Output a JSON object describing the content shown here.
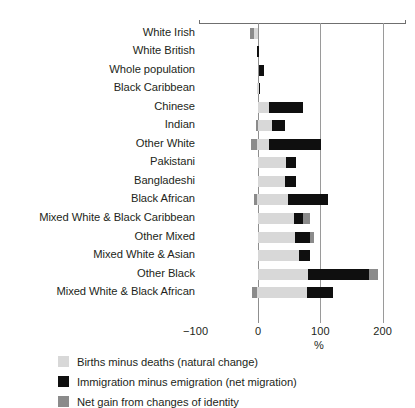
{
  "chart_data": {
    "type": "bar",
    "orientation": "horizontal",
    "stacked": true,
    "title": "",
    "subtitle": "",
    "xlabel": "%",
    "ylabel": "",
    "xlim": [
      -100,
      200
    ],
    "xticks": [
      -100,
      0,
      100,
      200
    ],
    "xticklabels": [
      "−100",
      "0",
      "100",
      "200"
    ],
    "grid": "vertical gridlines at 0, 100, 200",
    "legend_position": "bottom-left",
    "categories": [
      "White Irish",
      "White British",
      "Whole population",
      "Black Caribbean",
      "Chinese",
      "Indian",
      "Other White",
      "Pakistani",
      "Bangladeshi",
      "Black African",
      "Mixed White & Black Caribbean",
      "Other Mixed",
      "Mixed White & Asian",
      "Other Black",
      "Mixed White & Black African"
    ],
    "series": [
      {
        "name": "Births minus deaths (natural change)",
        "color": "#d8d8d8",
        "values": [
          -7,
          1,
          8,
          3,
          17,
          22,
          20,
          45,
          44,
          48,
          57,
          60,
          65,
          80,
          78
        ]
      },
      {
        "name": "Immigration minus emigration (net migration)",
        "color": "#0f0f0f",
        "values": [
          0,
          -2,
          0,
          -2,
          56,
          22,
          82,
          16,
          16,
          64,
          14,
          28,
          18,
          98,
          42
        ]
      },
      {
        "name": "Net gain from changes of identity",
        "color": "#8b8b8b",
        "values": [
          -6,
          0,
          0,
          0,
          0,
          -3,
          -10,
          0,
          0,
          -5,
          10,
          5,
          0,
          14,
          -8
        ]
      }
    ],
    "bars": [
      {
        "category": "White Irish",
        "segments": [
          {
            "series": "Net gain from changes of identity",
            "start": -13,
            "end": -7
          },
          {
            "series": "Births minus deaths (natural change)",
            "start": -7,
            "end": 0
          }
        ]
      },
      {
        "category": "White British",
        "segments": [
          {
            "series": "Immigration minus emigration (net migration)",
            "start": -1,
            "end": 1
          }
        ]
      },
      {
        "category": "Whole population",
        "segments": [
          {
            "series": "Immigration minus emigration (net migration)",
            "start": 2,
            "end": 9
          }
        ]
      },
      {
        "category": "Black Caribbean",
        "segments": [
          {
            "series": "Births minus deaths (natural change)",
            "start": -1,
            "end": 2
          },
          {
            "series": "Immigration minus emigration (net migration)",
            "start": 2,
            "end": 4
          }
        ]
      },
      {
        "category": "Chinese",
        "segments": [
          {
            "series": "Births minus deaths (natural change)",
            "start": 0,
            "end": 17
          },
          {
            "series": "Immigration minus emigration (net migration)",
            "start": 17,
            "end": 73
          }
        ]
      },
      {
        "category": "Indian",
        "segments": [
          {
            "series": "Net gain from changes of identity",
            "start": -4,
            "end": 0
          },
          {
            "series": "Births minus deaths (natural change)",
            "start": 0,
            "end": 22
          },
          {
            "series": "Immigration minus emigration (net migration)",
            "start": 22,
            "end": 44
          }
        ]
      },
      {
        "category": "Other White",
        "segments": [
          {
            "series": "Net gain from changes of identity",
            "start": -12,
            "end": -2
          },
          {
            "series": "Births minus deaths (natural change)",
            "start": -2,
            "end": 18
          },
          {
            "series": "Immigration minus emigration (net migration)",
            "start": 18,
            "end": 101
          }
        ]
      },
      {
        "category": "Pakistani",
        "segments": [
          {
            "series": "Births minus deaths (natural change)",
            "start": 0,
            "end": 45
          },
          {
            "series": "Immigration minus emigration (net migration)",
            "start": 45,
            "end": 61
          }
        ]
      },
      {
        "category": "Bangladeshi",
        "segments": [
          {
            "series": "Births minus deaths (natural change)",
            "start": 0,
            "end": 44
          },
          {
            "series": "Immigration minus emigration (net migration)",
            "start": 44,
            "end": 61
          }
        ]
      },
      {
        "category": "Black African",
        "segments": [
          {
            "series": "Net gain from changes of identity",
            "start": -6,
            "end": -1
          },
          {
            "series": "Births minus deaths (natural change)",
            "start": -1,
            "end": 48
          },
          {
            "series": "Immigration minus emigration (net migration)",
            "start": 48,
            "end": 112
          }
        ]
      },
      {
        "category": "Mixed White & Black Caribbean",
        "segments": [
          {
            "series": "Births minus deaths (natural change)",
            "start": 0,
            "end": 57
          },
          {
            "series": "Immigration minus emigration (net migration)",
            "start": 57,
            "end": 72
          },
          {
            "series": "Net gain from changes of identity",
            "start": 72,
            "end": 83
          }
        ]
      },
      {
        "category": "Other Mixed",
        "segments": [
          {
            "series": "Births minus deaths (natural change)",
            "start": 0,
            "end": 60
          },
          {
            "series": "Immigration minus emigration (net migration)",
            "start": 60,
            "end": 83
          },
          {
            "series": "Net gain from changes of identity",
            "start": 83,
            "end": 90
          }
        ]
      },
      {
        "category": "Mixed White & Asian",
        "segments": [
          {
            "series": "Births minus deaths (natural change)",
            "start": 0,
            "end": 65
          },
          {
            "series": "Immigration minus emigration (net migration)",
            "start": 65,
            "end": 84
          }
        ]
      },
      {
        "category": "Other Black",
        "segments": [
          {
            "series": "Births minus deaths (natural change)",
            "start": 0,
            "end": 80
          },
          {
            "series": "Immigration minus emigration (net migration)",
            "start": 80,
            "end": 178
          },
          {
            "series": "Net gain from changes of identity",
            "start": 178,
            "end": 192
          }
        ]
      },
      {
        "category": "Mixed White & Black African",
        "segments": [
          {
            "series": "Net gain from changes of identity",
            "start": -9,
            "end": -2
          },
          {
            "series": "Births minus deaths (natural change)",
            "start": -2,
            "end": 78
          },
          {
            "series": "Immigration minus emigration (net migration)",
            "start": 78,
            "end": 120
          }
        ]
      }
    ]
  },
  "legend": {
    "items": [
      {
        "label": "Births minus deaths (natural change)",
        "color": "#d8d8d8",
        "swatch_name": "legend-swatch-natural-change"
      },
      {
        "label": "Immigration minus emigration (net migration)",
        "color": "#0f0f0f",
        "swatch_name": "legend-swatch-net-migration"
      },
      {
        "label": "Net gain from changes of identity",
        "color": "#8b8b8b",
        "swatch_name": "legend-swatch-identity-change"
      }
    ]
  }
}
